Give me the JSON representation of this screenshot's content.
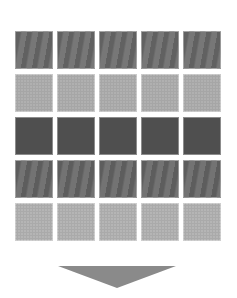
{
  "diagram": {
    "rows": [
      {
        "name": "row-1",
        "color": "#6e6e6e",
        "texture": "streak",
        "tiles": 5
      },
      {
        "name": "row-2",
        "color": "#b0b0b0",
        "texture": "dots",
        "tiles": 5
      },
      {
        "name": "row-3",
        "color": "#4f4f4f",
        "texture": "none",
        "tiles": 5
      },
      {
        "name": "row-4",
        "color": "#6a6a6a",
        "texture": "streak",
        "tiles": 5
      },
      {
        "name": "row-5",
        "color": "#b5b5b5",
        "texture": "dots",
        "tiles": 5
      }
    ],
    "arrow": {
      "direction": "down",
      "color": "#8a8a8a"
    }
  }
}
